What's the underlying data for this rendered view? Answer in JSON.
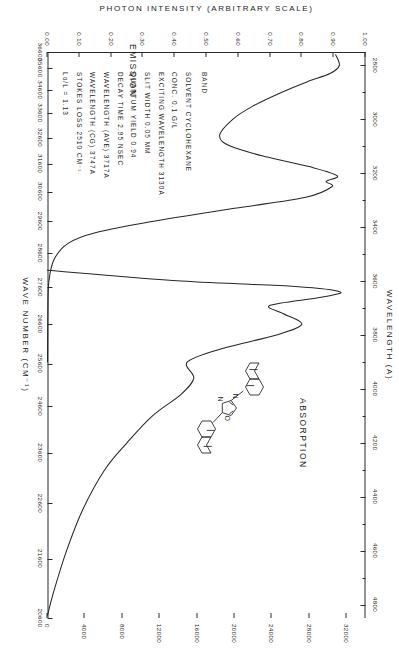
{
  "chart_data": {
    "type": "line",
    "title": "",
    "orientation": "rotated-90",
    "axes": {
      "top": {
        "label": "WAVELENGTH  (A)",
        "ticks": [
          2800,
          3000,
          3200,
          3400,
          3600,
          3800,
          4000,
          4200,
          4400,
          4600,
          4800
        ],
        "range": [
          2750,
          4850
        ],
        "units": "angstrom"
      },
      "bottom": {
        "label": "WAVE NUMBER  (CM⁻¹)",
        "ticks": [
          36600,
          35600,
          34600,
          33600,
          32600,
          31600,
          30600,
          29600,
          28600,
          27600,
          26600,
          25600,
          24600,
          23600,
          22600,
          21600,
          20600
        ],
        "range": [
          36600,
          20600
        ],
        "units": "cm-1"
      },
      "left": {
        "label": "PHOTON INTENSITY (ARBITRARY SCALE)",
        "ticks": [
          "1.00",
          "0.90",
          "0.80",
          "0.70",
          "0.60",
          "0.50",
          "0.40",
          "0.30",
          "0.20",
          "0.10",
          "0.00"
        ],
        "range": [
          0.0,
          1.0
        ]
      },
      "right": {
        "label": "MOLAR EXTINCTION COEFFICIENT (ε)",
        "ticks": [
          32000,
          28000,
          24000,
          20000,
          16000,
          12000,
          8000,
          4000,
          0
        ],
        "range": [
          0,
          34000
        ]
      }
    },
    "series": [
      {
        "name": "ABSORPTION",
        "axis": "molar-extinction",
        "description": "Absorption spectrum of 2,5-di(2-naphthyl)-1,3,4-oxadiazole in cyclohexane",
        "points": [
          {
            "wavelength": 2760,
            "epsilon": 30800
          },
          {
            "wavelength": 2800,
            "epsilon": 31200
          },
          {
            "wavelength": 2830,
            "epsilon": 30200
          },
          {
            "wavelength": 2860,
            "epsilon": 27800
          },
          {
            "wavelength": 2900,
            "epsilon": 25000
          },
          {
            "wavelength": 2950,
            "epsilon": 22000
          },
          {
            "wavelength": 3000,
            "epsilon": 19800
          },
          {
            "wavelength": 3060,
            "epsilon": 18400
          },
          {
            "wavelength": 3100,
            "epsilon": 19600
          },
          {
            "wavelength": 3140,
            "epsilon": 23500
          },
          {
            "wavelength": 3180,
            "epsilon": 28500
          },
          {
            "wavelength": 3210,
            "epsilon": 31000
          },
          {
            "wavelength": 3230,
            "epsilon": 29800
          },
          {
            "wavelength": 3250,
            "epsilon": 30400
          },
          {
            "wavelength": 3290,
            "epsilon": 27500
          },
          {
            "wavelength": 3330,
            "epsilon": 20000
          },
          {
            "wavelength": 3380,
            "epsilon": 11000
          },
          {
            "wavelength": 3420,
            "epsilon": 5200
          },
          {
            "wavelength": 3460,
            "epsilon": 2200
          },
          {
            "wavelength": 3520,
            "epsilon": 700
          },
          {
            "wavelength": 3600,
            "epsilon": 150
          },
          {
            "wavelength": 3700,
            "epsilon": 40
          },
          {
            "wavelength": 3900,
            "epsilon": 0
          }
        ]
      },
      {
        "name": "EMISSION",
        "axis": "photon-intensity",
        "description": "Fluorescence emission spectrum",
        "points": [
          {
            "wavelength": 3560,
            "intensity": 0.0
          },
          {
            "wavelength": 3600,
            "intensity": 0.42
          },
          {
            "wavelength": 3620,
            "intensity": 0.78
          },
          {
            "wavelength": 3640,
            "intensity": 0.92
          },
          {
            "wavelength": 3660,
            "intensity": 0.86
          },
          {
            "wavelength": 3690,
            "intensity": 0.7
          },
          {
            "wavelength": 3720,
            "intensity": 0.74
          },
          {
            "wavelength": 3760,
            "intensity": 0.8
          },
          {
            "wavelength": 3800,
            "intensity": 0.72
          },
          {
            "wavelength": 3850,
            "intensity": 0.55
          },
          {
            "wavelength": 3900,
            "intensity": 0.44
          },
          {
            "wavelength": 3960,
            "intensity": 0.46
          },
          {
            "wavelength": 4020,
            "intensity": 0.42
          },
          {
            "wavelength": 4100,
            "intensity": 0.33
          },
          {
            "wavelength": 4200,
            "intensity": 0.25
          },
          {
            "wavelength": 4300,
            "intensity": 0.18
          },
          {
            "wavelength": 4450,
            "intensity": 0.11
          },
          {
            "wavelength": 4600,
            "intensity": 0.06
          },
          {
            "wavelength": 4750,
            "intensity": 0.02
          },
          {
            "wavelength": 4840,
            "intensity": 0.0
          }
        ]
      }
    ]
  },
  "series_labels": {
    "absorption": "ABSORPTION",
    "emission": "EMISSION"
  },
  "axis_titles": {
    "wavelength": "WAVELENGTH  (A)",
    "wavenumber": "WAVE NUMBER  (CM⁻¹)",
    "photon_intensity": "PHOTON INTENSITY (ARBITRARY SCALE)",
    "molar_extinction": "MOLAR EXTINCTION COEFFICIENT (ε)"
  },
  "band_label": "BAND",
  "parameters": [
    "SOLVENT  CYCLOHEXANE",
    "CONC.  0.1 G/L",
    "EXCITING WAVELENGTH  3130A",
    "SLIT WIDTH  0.05 MM",
    "QUANTUM YIELD  0.94",
    "DECAY TIME  2.95 NSEC",
    "WAVELENGTH (AVE)  3717A",
    "WAVELENGTH (CG)  3747A",
    "STOKES LOSS  2510 CM⁻¹",
    "Lo/L = 1.13"
  ],
  "molecule": {
    "name": "2,5-di(2-naphthyl)-1,3,4-oxadiazole",
    "atom_labels": [
      "N",
      "N",
      "O"
    ]
  },
  "colors": {
    "ink": "#262626",
    "paper": "#ffffff"
  }
}
